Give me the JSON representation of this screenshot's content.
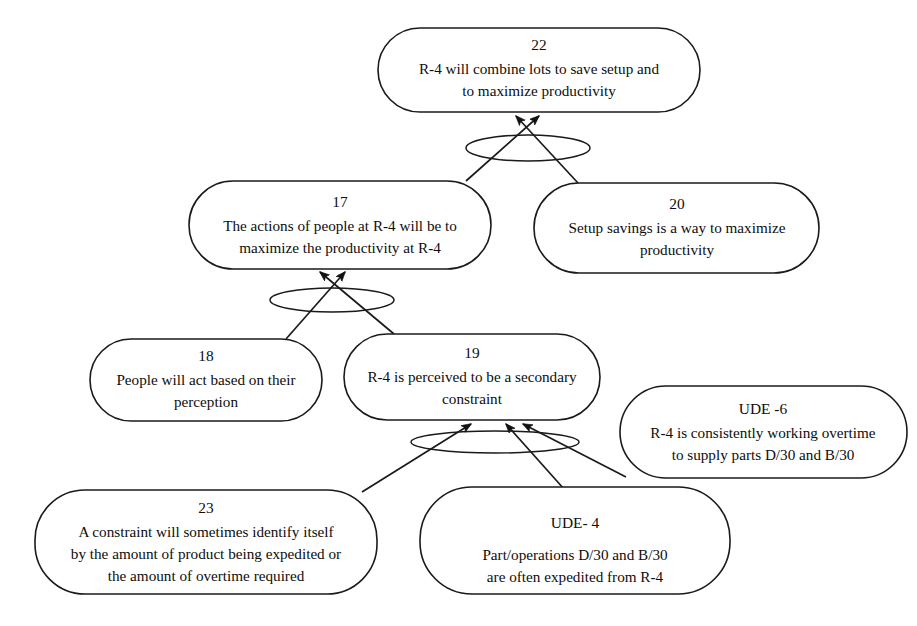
{
  "diagram": {
    "type": "current-reality-tree",
    "background_color": "#ffffff",
    "line_color": "#1a1a1a",
    "text_color": "#0d0d0d",
    "nodes": [
      {
        "key": "n22",
        "id_label": "22",
        "lines": [
          "R-4 will combine lots to save setup  and",
          "to maximize productivity"
        ],
        "x": 378,
        "y": 28,
        "w": 322,
        "h": 84
      },
      {
        "key": "n17",
        "id_label": "17",
        "lines": [
          "The actions of people  at R-4 will be to",
          "maximize the productivity at R-4"
        ],
        "x": 189,
        "y": 181,
        "w": 302,
        "h": 88
      },
      {
        "key": "n20",
        "id_label": "20",
        "lines": [
          "Setup savings is a way to maximize",
          "productivity"
        ],
        "x": 534,
        "y": 183,
        "w": 285,
        "h": 90
      },
      {
        "key": "n18",
        "id_label": "18",
        "lines": [
          "People will act based on their",
          "perception"
        ],
        "x": 90,
        "y": 339,
        "w": 232,
        "h": 82
      },
      {
        "key": "n19",
        "id_label": "19",
        "lines": [
          "R-4 is perceived to be a secondary",
          "constraint"
        ],
        "x": 344,
        "y": 334,
        "w": 256,
        "h": 86
      },
      {
        "key": "ude6",
        "id_label": "UDE -6",
        "lines": [
          "R-4 is  consistently working overtime",
          "to supply parts D/30  and B/30"
        ],
        "x": 620,
        "y": 386,
        "w": 287,
        "h": 92
      },
      {
        "key": "n23",
        "id_label": "23",
        "lines": [
          "A constraint will sometimes  identify itself",
          "by the amount of product being expedited or",
          "the amount of overtime required"
        ],
        "x": 35,
        "y": 490,
        "w": 342,
        "h": 104
      },
      {
        "key": "ude4",
        "id_label": "UDE- 4",
        "lines": [
          "",
          "Part/operations D/30 and B/30",
          "are often expedited from R-4"
        ],
        "x": 420,
        "y": 487,
        "w": 310,
        "h": 107
      }
    ],
    "logic_ellipses": [
      {
        "key": "and-22",
        "cx": 528,
        "cy": 148,
        "rx": 62,
        "ry": 13
      },
      {
        "key": "and-17",
        "cx": 332,
        "cy": 300,
        "rx": 62,
        "ry": 12
      },
      {
        "key": "and-19",
        "cx": 495,
        "cy": 442,
        "rx": 84,
        "ry": 11
      }
    ],
    "edges": [
      {
        "key": "e17-22",
        "from": "n17",
        "to": "n22"
      },
      {
        "key": "e20-22",
        "from": "n20",
        "to": "n22"
      },
      {
        "key": "e18-17",
        "from": "n18",
        "to": "n17"
      },
      {
        "key": "e19-17",
        "from": "n19",
        "to": "n17"
      },
      {
        "key": "e23-19",
        "from": "n23",
        "to": "n19"
      },
      {
        "key": "eude4-19",
        "from": "ude4",
        "to": "n19"
      },
      {
        "key": "eude6-19",
        "from": "ude6",
        "to": "n19"
      }
    ]
  }
}
